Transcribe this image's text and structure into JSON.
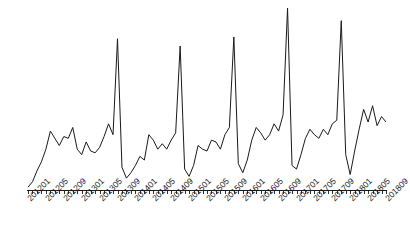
{
  "chart_data": {
    "type": "line",
    "title": "",
    "subtitle": "",
    "xlabel": "",
    "ylabel": "",
    "grid": false,
    "legend": null,
    "legend_position": "none",
    "y_axis_visible": false,
    "x_axis_visible": true,
    "line_color": "#1a1a1a",
    "line_width": 1,
    "background_color": "#ffffff",
    "x_tick_interval_months": 1,
    "x_label_interval_months": 4,
    "xlim": [
      "201201",
      "201809"
    ],
    "ylim": [
      0,
      100
    ],
    "tick_labels": [
      "201201",
      "201205",
      "201209",
      "201301",
      "201305",
      "201309",
      "201401",
      "201405",
      "201409",
      "201501",
      "201505",
      "201509",
      "201601",
      "201605",
      "201609",
      "201701",
      "201705",
      "201709",
      "201801",
      "201805",
      "201809"
    ],
    "x": [
      "201201",
      "201202",
      "201203",
      "201204",
      "201205",
      "201206",
      "201207",
      "201208",
      "201209",
      "201210",
      "201211",
      "201212",
      "201301",
      "201302",
      "201303",
      "201304",
      "201305",
      "201306",
      "201307",
      "201308",
      "201309",
      "201310",
      "201311",
      "201312",
      "201401",
      "201402",
      "201403",
      "201404",
      "201405",
      "201406",
      "201407",
      "201408",
      "201409",
      "201410",
      "201411",
      "201412",
      "201501",
      "201502",
      "201503",
      "201504",
      "201505",
      "201506",
      "201507",
      "201508",
      "201509",
      "201510",
      "201511",
      "201512",
      "201601",
      "201602",
      "201603",
      "201604",
      "201605",
      "201606",
      "201607",
      "201608",
      "201609",
      "201610",
      "201611",
      "201612",
      "201701",
      "201702",
      "201703",
      "201704",
      "201705",
      "201706",
      "201707",
      "201708",
      "201709",
      "201710",
      "201711",
      "201712",
      "201801",
      "201802",
      "201803",
      "201804",
      "201805",
      "201806",
      "201807",
      "201808",
      "201809"
    ],
    "values": [
      1,
      4,
      10,
      15,
      22,
      32,
      28,
      24,
      29,
      28,
      34,
      22,
      19,
      26,
      21,
      20,
      23,
      29,
      36,
      30,
      83,
      12,
      6,
      9,
      13,
      18,
      16,
      30,
      27,
      22,
      25,
      22,
      27,
      31,
      79,
      11,
      7,
      13,
      24,
      22,
      21,
      27,
      26,
      22,
      30,
      34,
      84,
      14,
      9,
      16,
      27,
      34,
      31,
      27,
      30,
      36,
      32,
      41,
      100,
      13,
      11,
      19,
      28,
      33,
      30,
      28,
      33,
      30,
      36,
      38,
      93,
      19,
      8,
      21,
      33,
      44,
      37,
      46,
      35,
      40,
      37
    ],
    "series_name": "monthly series",
    "n_points": 81,
    "peaks": [
      {
        "x": "201311",
        "value": 83
      },
      {
        "x": "201411",
        "value": 79
      },
      {
        "x": "201511",
        "value": 84
      },
      {
        "x": "201611",
        "value": 100
      },
      {
        "x": "201711",
        "value": 93
      }
    ]
  }
}
